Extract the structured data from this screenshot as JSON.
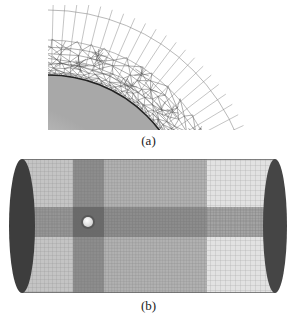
{
  "figure": {
    "panels": [
      {
        "id": "a",
        "label": "(a)",
        "description": "Close-up of unstructured tetrahedral boundary-layer mesh wrapped around a curved (spherical) body surface, transitioning to a structured radial/curvilinear grid outward"
      },
      {
        "id": "b",
        "label": "(b)",
        "description": "Cylindrical computational domain with structured hexahedral grid; dark elliptical end caps; small white sphere near the upstream side with grid refinement bands crossing at the sphere"
      }
    ],
    "colors": {
      "background": "#ffffff",
      "mesh_line": "#555555",
      "body_fill": "#d8d8d8",
      "end_cap": "#3a3a3a",
      "grid_dense": "#6b6b6b",
      "grid_light": "#b5b5b5",
      "sphere": "#f4f4f4"
    }
  }
}
